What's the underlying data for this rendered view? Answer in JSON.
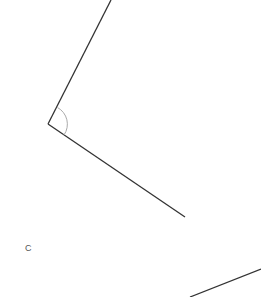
{
  "diagram": {
    "type": "geometry-angle",
    "labels": {
      "point_c": "C"
    },
    "colors": {
      "line": "#333333",
      "arc": "#aaaaaa",
      "label": "#555555",
      "background": "#ffffff"
    }
  }
}
